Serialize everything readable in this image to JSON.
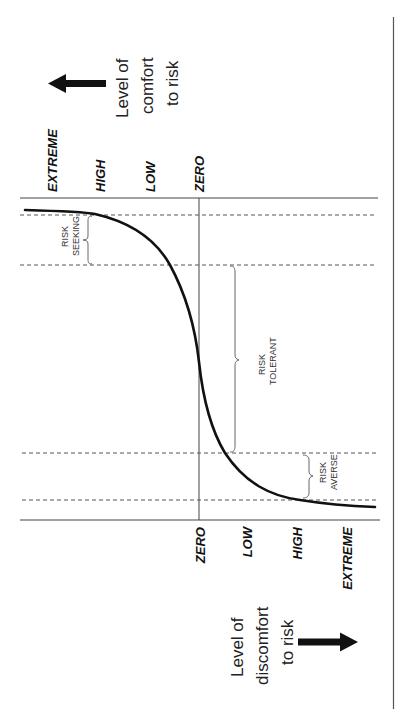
{
  "diagram": {
    "orientation": "rotated 90 degrees counter-clockwise",
    "comfort_axis": {
      "caption_lines": [
        "Level of",
        "comfort",
        "to risk"
      ],
      "arrow_direction": "left",
      "labels": [
        "EXTREME",
        "HIGH",
        "LOW",
        "ZERO"
      ]
    },
    "discomfort_axis": {
      "caption_lines": [
        "Level of",
        "discomfort",
        "to risk"
      ],
      "arrow_direction": "right",
      "labels": [
        "ZERO",
        "LOW",
        "HIGH",
        "EXTREME"
      ]
    },
    "zones": [
      {
        "name": "risk-seeking",
        "lines": [
          "RISK",
          "SEEKING"
        ]
      },
      {
        "name": "risk-tolerant",
        "lines": [
          "RISK",
          "TOLERANT"
        ]
      },
      {
        "name": "risk-averse",
        "lines": [
          "RISK",
          "AVERSE"
        ]
      }
    ],
    "colors": {
      "curve": "#111111",
      "axis": "#444444",
      "dashed": "#555555",
      "brace": "#666666",
      "text": "#111111",
      "background": "#ffffff"
    }
  }
}
